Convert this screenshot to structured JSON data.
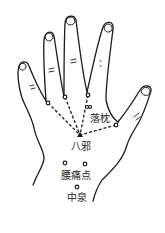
{
  "diagram": {
    "colors": {
      "ink": "#1a1a1a",
      "background": "#ffffff"
    },
    "labels": {
      "luozhen": "落枕",
      "baxie": "八邪",
      "yaotongdian": "腰痛点",
      "zhongquan": "中泉"
    },
    "points": [
      {
        "name": "baxie-pinky-ring",
        "x": 48,
        "y": 103
      },
      {
        "name": "baxie-ring-middle",
        "x": 65,
        "y": 97
      },
      {
        "name": "baxie-middle-index",
        "x": 88,
        "y": 95
      },
      {
        "name": "luozhen",
        "x": 88,
        "y": 107
      },
      {
        "name": "baxie-index-thumb",
        "x": 116,
        "y": 125
      },
      {
        "name": "yaotongdian-1",
        "x": 65,
        "y": 163
      },
      {
        "name": "yaotongdian-2",
        "x": 85,
        "y": 164
      },
      {
        "name": "zhongquan",
        "x": 77,
        "y": 187
      }
    ]
  }
}
